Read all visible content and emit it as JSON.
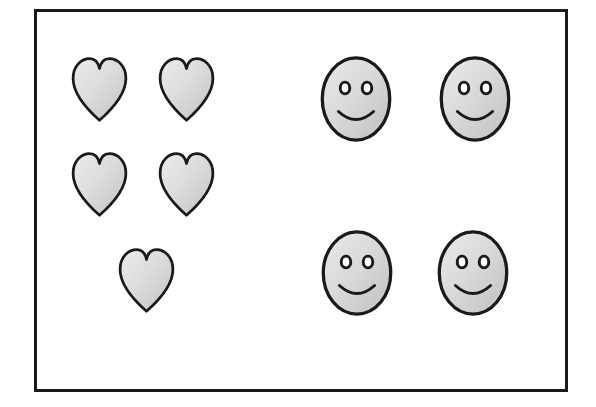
{
  "illustration": {
    "title": "Hearts and Smiley Faces",
    "background_color": "#ffffff",
    "frame": {
      "border_color": "#1a1a1a",
      "border_width_px": 3,
      "x": 34,
      "y": 9,
      "width": 534,
      "height": 383
    },
    "palette": {
      "outline": "#1a1a1a",
      "fill_light": "#e2e2e2",
      "fill_mid": "#d2d2d2",
      "fill_dark": "#bdbdbd"
    },
    "groups": [
      {
        "name": "hearts-group",
        "shape": "heart",
        "label": "Hearts",
        "count": 5,
        "side": "left",
        "rows": [
          2,
          2,
          1
        ],
        "items": [
          {
            "name": "heart-1",
            "row": 1,
            "col": 1,
            "x": 72,
            "y": 56,
            "width": 55,
            "height": 67
          },
          {
            "name": "heart-2",
            "row": 1,
            "col": 2,
            "x": 159,
            "y": 56,
            "width": 55,
            "height": 67
          },
          {
            "name": "heart-3",
            "row": 2,
            "col": 1,
            "x": 72,
            "y": 151,
            "width": 55,
            "height": 67
          },
          {
            "name": "heart-4",
            "row": 2,
            "col": 2,
            "x": 159,
            "y": 151,
            "width": 55,
            "height": 67
          },
          {
            "name": "heart-5",
            "row": 3,
            "col": 1,
            "x": 119,
            "y": 247,
            "width": 55,
            "height": 67
          }
        ]
      },
      {
        "name": "faces-group",
        "shape": "smiley-face",
        "label": "Smiley Faces",
        "count": 4,
        "side": "right",
        "rows": [
          2,
          2
        ],
        "features": [
          "left-eye",
          "right-eye",
          "smile"
        ],
        "items": [
          {
            "name": "face-1",
            "row": 1,
            "col": 1,
            "x": 319,
            "y": 55,
            "width": 74,
            "height": 88
          },
          {
            "name": "face-2",
            "row": 1,
            "col": 2,
            "x": 438,
            "y": 55,
            "width": 74,
            "height": 88
          },
          {
            "name": "face-3",
            "row": 2,
            "col": 1,
            "x": 320,
            "y": 229,
            "width": 74,
            "height": 88
          },
          {
            "name": "face-4",
            "row": 2,
            "col": 2,
            "x": 436,
            "y": 229,
            "width": 74,
            "height": 88
          }
        ]
      }
    ]
  }
}
